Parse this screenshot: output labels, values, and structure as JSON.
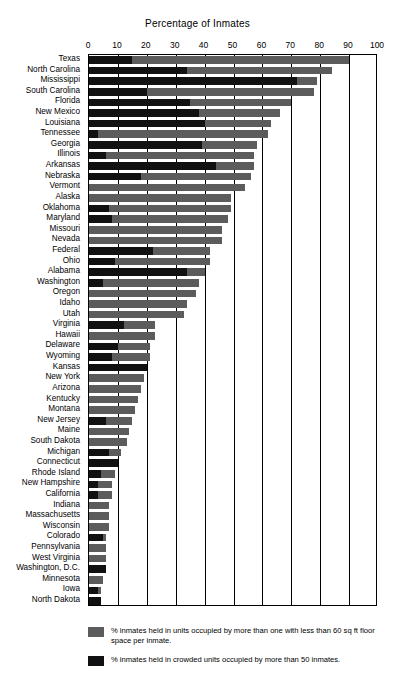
{
  "chart_data": {
    "type": "bar",
    "orientation": "horizontal",
    "stacked": true,
    "title": "Percentage of Inmates",
    "xlabel": "Percentage of Inmates",
    "ylabel": "",
    "xlim": [
      0,
      100
    ],
    "xticks": [
      0,
      10,
      20,
      30,
      40,
      50,
      60,
      70,
      80,
      90,
      100
    ],
    "grid": true,
    "legend_position": "bottom",
    "categories": [
      "Texas",
      "North Carolina",
      "Mississippi",
      "South Carolina",
      "Florida",
      "New Mexico",
      "Louisiana",
      "Tennessee",
      "Georgia",
      "Illinois",
      "Arkansas",
      "Nebraska",
      "Vermont",
      "Alaska",
      "Oklahoma",
      "Maryland",
      "Missouri",
      "Nevada",
      "Federal",
      "Ohio",
      "Alabama",
      "Washington",
      "Oregon",
      "Idaho",
      "Utah",
      "Virginia",
      "Hawaii",
      "Delaware",
      "Wyoming",
      "Kansas",
      "New York",
      "Arizona",
      "Kentucky",
      "Montana",
      "New Jersey",
      "Maine",
      "South Dakota",
      "Michigan",
      "Connecticut",
      "Rhode Island",
      "New Hampshire",
      "California",
      "Indiana",
      "Massachusetts",
      "Wisconsin",
      "Colorado",
      "Pennsylvania",
      "West Virginia",
      "Washington, D.C.",
      "Minnesota",
      "Iowa",
      "North Dakota"
    ],
    "series": [
      {
        "name": "% inmates held in crowded units occupied by more than 50 inmates.",
        "key": "crowded_units_50_plus",
        "color": "#111111",
        "values": [
          15,
          34,
          72,
          20,
          35,
          38,
          40,
          3,
          39,
          6,
          44,
          18,
          0,
          0,
          7,
          8,
          0,
          0,
          22,
          9,
          34,
          5,
          0,
          0,
          0,
          12,
          0,
          10,
          8,
          20,
          0,
          0,
          0,
          0,
          6,
          0,
          0,
          7,
          10,
          4,
          3,
          3,
          0,
          0,
          0,
          5,
          0,
          0,
          6,
          0,
          3,
          4
        ]
      },
      {
        "name": "% inmates held in units occupied by more than one with less than 60 sq ft floor space per inmate.",
        "key": "under_60_sqft",
        "color": "#5c5c5c",
        "values": [
          90,
          84,
          79,
          78,
          70,
          66,
          63,
          62,
          58,
          57,
          57,
          56,
          54,
          49,
          49,
          48,
          46,
          46,
          42,
          42,
          40,
          38,
          37,
          34,
          33,
          23,
          23,
          21,
          21,
          20,
          19,
          18,
          17,
          16,
          15,
          14,
          13,
          11,
          10,
          9,
          8,
          8,
          7,
          7,
          7,
          6,
          6,
          6,
          6,
          5,
          4,
          4
        ]
      }
    ]
  },
  "axis": {
    "title": "Percentage of Inmates",
    "tick_labels": [
      "0",
      "10",
      "20",
      "30",
      "40",
      "50",
      "60",
      "70",
      "80",
      "90",
      "100"
    ]
  },
  "legend": {
    "items": [
      {
        "swatch": "light",
        "text": "% inmates held in units occupied by more than one with less than 60 sq ft floor space per inmate."
      },
      {
        "swatch": "dark",
        "text": "% inmates held in crowded units occupied by more than 50 inmates."
      }
    ]
  },
  "colors": {
    "dark": "#111111",
    "light": "#5c5c5c",
    "axis": "#000000",
    "background": "#ffffff"
  }
}
